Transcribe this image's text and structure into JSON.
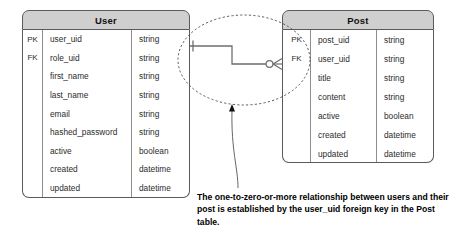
{
  "diagram": {
    "type": "entity-relationship-diagram",
    "notation": "crow's foot",
    "relationship": "one-to-zero-or-more",
    "caption": "The one-to-zero-or-more relationship between users and their post is established by the user_uid foreign key in the Post table.",
    "colors": {
      "header_fill": "#cfcfcf",
      "border": "#5a5a5a",
      "divider": "#8d8d8d",
      "text": "#2b2b2b",
      "connector": "#6e6e6e",
      "highlight_outline": "#4a4a4a"
    }
  },
  "entities": [
    {
      "name": "User",
      "columns": [
        "Key",
        "Attribute",
        "Type"
      ],
      "rows": [
        {
          "key": "PK",
          "attribute": "user_uid",
          "type": "string"
        },
        {
          "key": "FK",
          "attribute": "role_uid",
          "type": "string"
        },
        {
          "key": "",
          "attribute": "first_name",
          "type": "string"
        },
        {
          "key": "",
          "attribute": "last_name",
          "type": "string"
        },
        {
          "key": "",
          "attribute": "email",
          "type": "string"
        },
        {
          "key": "",
          "attribute": "hashed_password",
          "type": "string"
        },
        {
          "key": "",
          "attribute": "active",
          "type": "boolean"
        },
        {
          "key": "",
          "attribute": "created",
          "type": "datetime"
        },
        {
          "key": "",
          "attribute": "updated",
          "type": "datetime"
        }
      ]
    },
    {
      "name": "Post",
      "columns": [
        "Key",
        "Attribute",
        "Type"
      ],
      "rows": [
        {
          "key": "PK",
          "attribute": "post_uid",
          "type": "string"
        },
        {
          "key": "FK",
          "attribute": "user_uid",
          "type": "string"
        },
        {
          "key": "",
          "attribute": "title",
          "type": "string"
        },
        {
          "key": "",
          "attribute": "content",
          "type": "string"
        },
        {
          "key": "",
          "attribute": "active",
          "type": "boolean"
        },
        {
          "key": "",
          "attribute": "created",
          "type": "datetime"
        },
        {
          "key": "",
          "attribute": "updated",
          "type": "datetime"
        }
      ]
    }
  ],
  "connector": {
    "source_entity": "User",
    "source_cardinality": "one",
    "target_entity": "Post",
    "target_cardinality": "zero-or-more"
  }
}
